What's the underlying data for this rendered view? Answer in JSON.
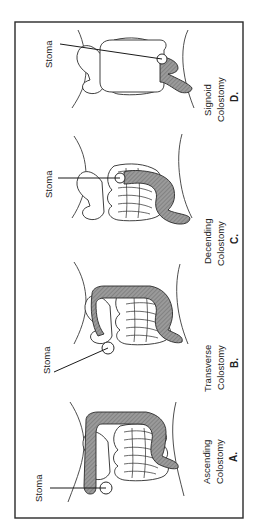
{
  "figure": {
    "orientation": "rotated-90-ccw",
    "colors": {
      "frame": "#2a2a2a",
      "colon_fill": "#8f8f8f",
      "background": "#ffffff"
    },
    "panels": [
      {
        "letter": "A.",
        "title_line1": "Ascending",
        "title_line2": "Colostomy",
        "stoma_label": "Stoma"
      },
      {
        "letter": "B.",
        "title_line1": "Transverse",
        "title_line2": "Colostomy",
        "stoma_label": "Stoma"
      },
      {
        "letter": "C.",
        "title_line1": "Decending",
        "title_line2": "Colostomy",
        "stoma_label": "Stoma"
      },
      {
        "letter": "D.",
        "title_line1": "Signoid",
        "title_line2": "Colostomy",
        "stoma_label": "Stoma"
      }
    ]
  }
}
